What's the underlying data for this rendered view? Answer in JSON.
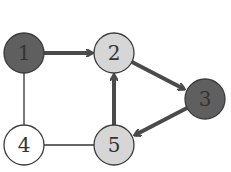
{
  "diagram": {
    "type": "directed-graph",
    "colors": {
      "dark": "#5f5f5f",
      "light": "#d6d6d6",
      "white": "#ffffff",
      "stroke": "#3a3a3a",
      "edge_thick": "#4a4a4a",
      "edge_thin": "#333333"
    },
    "nodes": [
      {
        "id": "1",
        "label": "1",
        "cx": 24,
        "cy": 53,
        "fill": "dark"
      },
      {
        "id": "2",
        "label": "2",
        "cx": 114,
        "cy": 53,
        "fill": "light"
      },
      {
        "id": "3",
        "label": "3",
        "cx": 205,
        "cy": 99,
        "fill": "dark"
      },
      {
        "id": "4",
        "label": "4",
        "cx": 24,
        "cy": 145,
        "fill": "white"
      },
      {
        "id": "5",
        "label": "5",
        "cx": 114,
        "cy": 145,
        "fill": "light"
      }
    ],
    "edges": [
      {
        "from": "1",
        "to": "2",
        "directed": true,
        "thick": true
      },
      {
        "from": "2",
        "to": "3",
        "directed": true,
        "thick": true
      },
      {
        "from": "3",
        "to": "5",
        "directed": true,
        "thick": true
      },
      {
        "from": "5",
        "to": "2",
        "directed": true,
        "thick": true
      },
      {
        "from": "1",
        "to": "4",
        "directed": false,
        "thick": false
      },
      {
        "from": "4",
        "to": "5",
        "directed": false,
        "thick": false
      }
    ],
    "node_radius": 20
  }
}
